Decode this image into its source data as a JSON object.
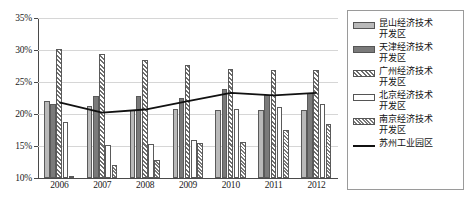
{
  "chart_data": {
    "type": "bar",
    "title": "",
    "xlabel": "",
    "ylabel": "",
    "categories": [
      "2006",
      "2007",
      "2008",
      "2009",
      "2010",
      "2011",
      "2012"
    ],
    "ylim": [
      10,
      35
    ],
    "ytick_values": [
      10,
      15,
      20,
      25,
      30,
      35
    ],
    "ytick_labels": [
      "10%",
      "15%",
      "20%",
      "25%",
      "30%",
      "35%"
    ],
    "grid": true,
    "legend_position": "right",
    "series": [
      {
        "name": "昆山经济技术开发区",
        "type": "bar",
        "pattern": "solid-light-gray",
        "color": "#b9b9b9",
        "values": [
          22.0,
          21.3,
          20.7,
          20.8,
          20.6,
          20.6,
          20.6
        ]
      },
      {
        "name": "天津经济技术开发区",
        "type": "bar",
        "pattern": "solid-dark-gray",
        "color": "#7a7a7a",
        "values": [
          21.5,
          22.8,
          22.8,
          22.5,
          23.9,
          23.0,
          23.3
        ]
      },
      {
        "name": "广州经济技术开发区",
        "type": "bar",
        "pattern": "diagonal-hatch",
        "color": "#6f6f6f",
        "values": [
          30.1,
          29.3,
          28.4,
          27.6,
          27.1,
          26.9,
          26.9
        ]
      },
      {
        "name": "北京经济技术开发区",
        "type": "bar",
        "pattern": "white-empty",
        "color": "#ffffff",
        "values": [
          18.7,
          15.2,
          15.3,
          15.9,
          20.8,
          21.1,
          21.5
        ]
      },
      {
        "name": "南京经济技术开发区",
        "type": "bar",
        "pattern": "dense-cross-hatch",
        "color": "#7a7a7a",
        "values": [
          10.3,
          12.0,
          12.8,
          15.5,
          15.7,
          17.5,
          18.4
        ]
      },
      {
        "name": "苏州工业园区",
        "type": "line",
        "pattern": "solid-line",
        "color": "#111111",
        "values": [
          21.8,
          20.2,
          20.7,
          22.0,
          23.3,
          22.9,
          23.3
        ]
      }
    ]
  },
  "legend": {
    "items": [
      {
        "label": "昆山经济技术\n开发区",
        "swatch": "solid-light-gray"
      },
      {
        "label": "天津经济技术\n开发区",
        "swatch": "solid-dark-gray"
      },
      {
        "label": "广州经济技术\n开发区",
        "swatch": "diagonal-hatch"
      },
      {
        "label": "北京经济技术\n开发区",
        "swatch": "white-empty"
      },
      {
        "label": "南京经济技术\n开发区",
        "swatch": "dense-cross-hatch"
      },
      {
        "label": "苏州工业园区",
        "swatch": "solid-line"
      }
    ]
  }
}
